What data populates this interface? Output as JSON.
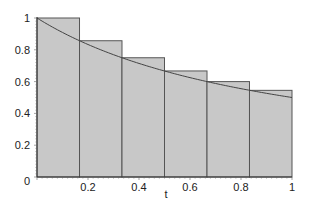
{
  "chart_data": {
    "type": "bar",
    "subtype": "left-riemann-sum-with-curve",
    "title": "",
    "xlabel": "t",
    "ylabel": "",
    "xlim": [
      0,
      1
    ],
    "ylim": [
      0,
      1
    ],
    "grid": false,
    "legend": null,
    "x_ticks": [
      "0",
      "0.2",
      "0.4",
      "0.6",
      "0.8",
      "1"
    ],
    "y_ticks": [
      "0.2",
      "0.4",
      "0.6",
      "0.8",
      "1"
    ],
    "bars": [
      {
        "x0": 0.0,
        "x1": 0.1667,
        "height": 1.0
      },
      {
        "x0": 0.1667,
        "x1": 0.3333,
        "height": 0.857
      },
      {
        "x0": 0.3333,
        "x1": 0.5,
        "height": 0.75
      },
      {
        "x0": 0.5,
        "x1": 0.6667,
        "height": 0.667
      },
      {
        "x0": 0.6667,
        "x1": 0.8333,
        "height": 0.6
      },
      {
        "x0": 0.8333,
        "x1": 1.0,
        "height": 0.545
      }
    ],
    "curve": {
      "description": "f(t) = 1/(1+t)",
      "x": [
        0,
        0.1,
        0.2,
        0.3,
        0.4,
        0.5,
        0.6,
        0.7,
        0.8,
        0.9,
        1.0
      ],
      "y": [
        1.0,
        0.909,
        0.833,
        0.769,
        0.714,
        0.667,
        0.625,
        0.588,
        0.556,
        0.526,
        0.5
      ]
    },
    "colors": {
      "bar_fill": "#c8c8c8",
      "bar_stroke": "#555555",
      "curve": "#444444",
      "axis": "#333333"
    }
  },
  "axes": {
    "x_label": "t",
    "origin_label": "0"
  }
}
